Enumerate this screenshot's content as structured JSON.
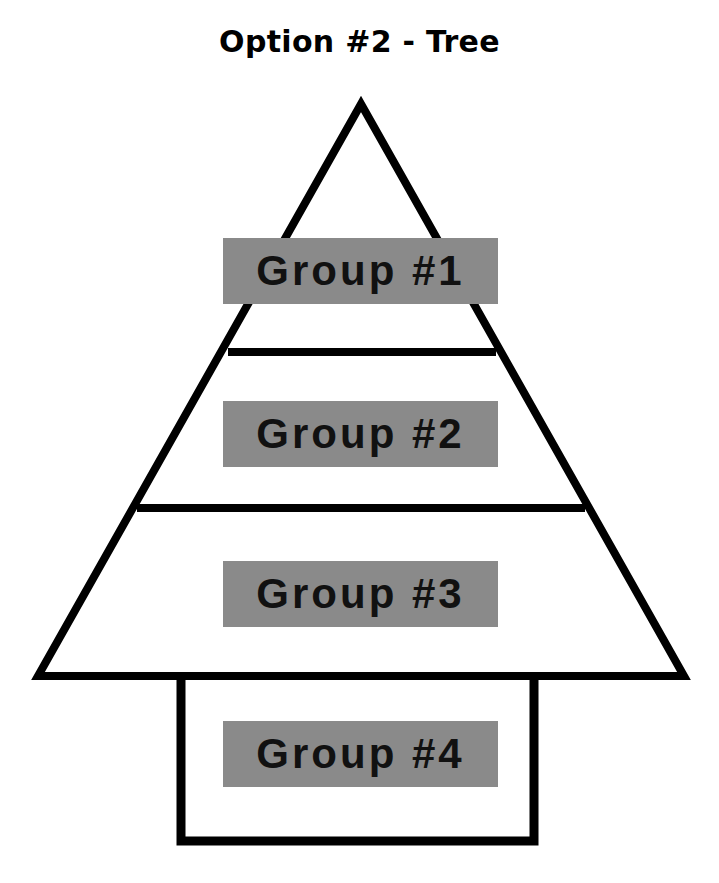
{
  "title": "Option #2 - Tree",
  "colors": {
    "stroke": "#000000",
    "label_bg": "#8a8a8a",
    "label_text": "#111111",
    "background": "#ffffff"
  },
  "groups": [
    {
      "label": "Group #1",
      "section": "triangle-top"
    },
    {
      "label": "Group #2",
      "section": "triangle-middle"
    },
    {
      "label": "Group #3",
      "section": "triangle-bottom"
    },
    {
      "label": "Group #4",
      "section": "trunk"
    }
  ]
}
